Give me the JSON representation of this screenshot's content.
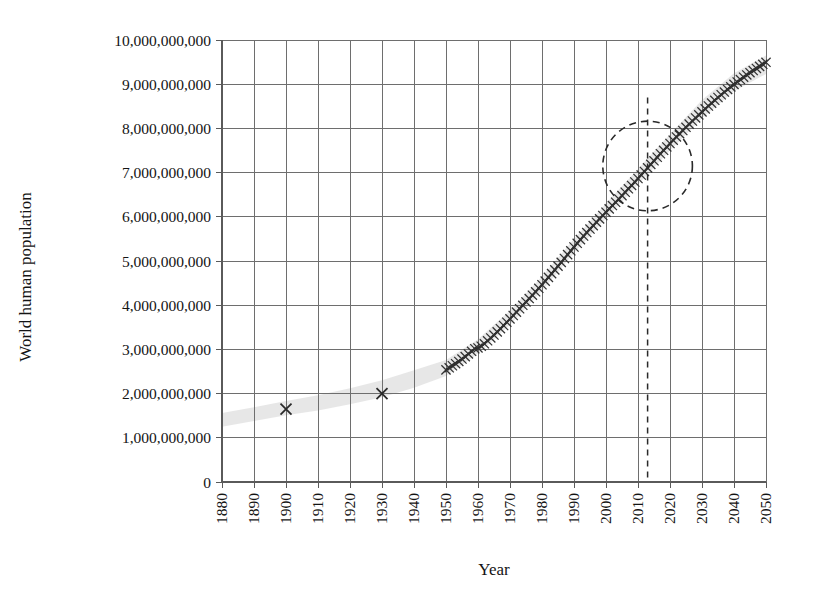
{
  "chart_data": {
    "type": "line",
    "title": "",
    "xlabel": "Year",
    "ylabel": "World human population",
    "xlim": [
      1880,
      2050
    ],
    "ylim": [
      0,
      10000000000
    ],
    "grid": true,
    "legend": "none",
    "x_tick_labels": [
      "1880",
      "1890",
      "1900",
      "1910",
      "1920",
      "1930",
      "1940",
      "1950",
      "1960",
      "1970",
      "1980",
      "1990",
      "2000",
      "2010",
      "2020",
      "2030",
      "2040",
      "2050"
    ],
    "y_tick_labels": [
      "10,000,000,000",
      "9,000,000,000",
      "8,000,000,000",
      "7,000,000,000",
      "6,000,000,000",
      "5,000,000,000",
      "4,000,000,000",
      "3,000,000,000",
      "2,000,000,000",
      "1,000,000,000",
      "0"
    ],
    "y_tick_values": [
      10000000000,
      9000000000,
      8000000000,
      7000000000,
      6000000000,
      5000000000,
      4000000000,
      3000000000,
      2000000000,
      1000000000,
      0
    ],
    "series": [
      {
        "name": "Sparse historical estimates",
        "marker": "x",
        "x": [
          1900,
          1930
        ],
        "values": [
          1650000000,
          2000000000
        ]
      },
      {
        "name": "World human population (annual, 1950-2050)",
        "marker": "x",
        "x": [
          1950,
          1951,
          1952,
          1953,
          1954,
          1955,
          1956,
          1957,
          1958,
          1959,
          1960,
          1961,
          1962,
          1963,
          1964,
          1965,
          1966,
          1967,
          1968,
          1969,
          1970,
          1971,
          1972,
          1973,
          1974,
          1975,
          1976,
          1977,
          1978,
          1979,
          1980,
          1981,
          1982,
          1983,
          1984,
          1985,
          1986,
          1987,
          1988,
          1989,
          1990,
          1991,
          1992,
          1993,
          1994,
          1995,
          1996,
          1997,
          1998,
          1999,
          2000,
          2001,
          2002,
          2003,
          2004,
          2005,
          2006,
          2007,
          2008,
          2009,
          2010,
          2011,
          2012,
          2013,
          2014,
          2015,
          2016,
          2017,
          2018,
          2019,
          2020,
          2021,
          2022,
          2023,
          2024,
          2025,
          2026,
          2027,
          2028,
          2029,
          2030,
          2031,
          2032,
          2033,
          2034,
          2035,
          2036,
          2037,
          2038,
          2039,
          2040,
          2041,
          2042,
          2043,
          2044,
          2045,
          2046,
          2047,
          2048,
          2049,
          2050
        ],
        "values": [
          2536000000,
          2584000000,
          2630000000,
          2677000000,
          2727000000,
          2781000000,
          2836000000,
          2897000000,
          2957000000,
          3015000000,
          3033000000,
          3073000000,
          3127000000,
          3194000000,
          3259000000,
          3325000000,
          3396000000,
          3468000000,
          3541000000,
          3616000000,
          3691000000,
          3767000000,
          3843000000,
          3920000000,
          3997000000,
          4074000000,
          4150000000,
          4226000000,
          4303000000,
          4382000000,
          4462000000,
          4544000000,
          4629000000,
          4715000000,
          4800000000,
          4884000000,
          4969000000,
          5057000000,
          5145000000,
          5231000000,
          5316000000,
          5400000000,
          5483000000,
          5564000000,
          5644000000,
          5723000000,
          5801000000,
          5878000000,
          5954000000,
          6029000000,
          6104000000,
          6179000000,
          6254000000,
          6329000000,
          6404000000,
          6480000000,
          6556000000,
          6633000000,
          6710000000,
          6788000000,
          6867000000,
          6946000000,
          7026000000,
          7107000000,
          7187000000,
          7267000000,
          7347000000,
          7426000000,
          7504000000,
          7581000000,
          7658000000,
          7733000000,
          7807000000,
          7880000000,
          7953000000,
          8025000000,
          8096000000,
          8167000000,
          8237000000,
          8306000000,
          8374000000,
          8441000000,
          8507000000,
          8572000000,
          8636000000,
          8699000000,
          8761000000,
          8822000000,
          8881000000,
          8939000000,
          8996000000,
          9051000000,
          9105000000,
          9158000000,
          9210000000,
          9260000000,
          9309000000,
          9357000000,
          9404000000,
          9450000000,
          9495000000
        ]
      }
    ],
    "uncertainty_band": {
      "description": "light grey shaded band behind the marker line",
      "color": "#d9d9d9",
      "x": [
        1880,
        1890,
        1900,
        1910,
        1920,
        1930,
        1940,
        1950,
        1960,
        1970,
        1980,
        1990,
        2000,
        2010,
        2020,
        2030,
        2040,
        2050
      ],
      "lower": [
        1250000000,
        1380000000,
        1510000000,
        1620000000,
        1760000000,
        1920000000,
        2130000000,
        2400000000,
        2900000000,
        3560000000,
        4330000000,
        5180000000,
        5970000000,
        6730000000,
        7500000000,
        8230000000,
        8840000000,
        9230000000
      ],
      "upper": [
        1560000000,
        1690000000,
        1830000000,
        1960000000,
        2120000000,
        2300000000,
        2530000000,
        2760000000,
        3230000000,
        3880000000,
        4650000000,
        5500000000,
        6300000000,
        7080000000,
        7870000000,
        8640000000,
        9250000000,
        9650000000
      ]
    },
    "annotations": [
      {
        "type": "circle",
        "name": "present-day-highlight-circle",
        "x": 2013,
        "y": 7150000000,
        "radius_years": 14,
        "style": "dashed"
      },
      {
        "type": "vline",
        "name": "present-day-marker-line",
        "x": 2013,
        "y_from": 0,
        "y_to": 8700000000,
        "style": "dashed"
      }
    ]
  },
  "colors": {
    "marker": "#2a2a2a",
    "gridline": "#6e6e6e",
    "band": "#d9d9d9",
    "annotation": "#2a2a2a",
    "background": "#ffffff"
  }
}
